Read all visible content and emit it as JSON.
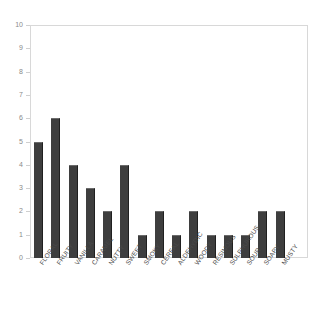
{
  "chart_data": {
    "type": "bar",
    "title": "",
    "subtitle": "",
    "xlabel": "",
    "ylabel": "",
    "ylim": [
      0,
      10
    ],
    "yticks": [
      0,
      1,
      2,
      3,
      4,
      5,
      6,
      7,
      8,
      9,
      10
    ],
    "grid": false,
    "legend": "none",
    "categories": [
      "FLORAL",
      "FRUITY",
      "VANILLA",
      "CARAMEL",
      "NUTTY",
      "SWEET",
      "SMOKY",
      "CEREAL",
      "ALDEHYDIC",
      "WOODY",
      "RESINOUS",
      "SULPHUROUS",
      "SOUR",
      "SOAPY",
      "MUSTY"
    ],
    "values": [
      5,
      6,
      4,
      3,
      2,
      4,
      1,
      2,
      1,
      2,
      1,
      1,
      1,
      2,
      2
    ],
    "bar_color": "#3e3e3e",
    "axis_color": "#d8d8d8",
    "tick_label_color": "#8a8a8a",
    "category_label_color": "#4a4a4a",
    "background_color": "#ffffff"
  }
}
